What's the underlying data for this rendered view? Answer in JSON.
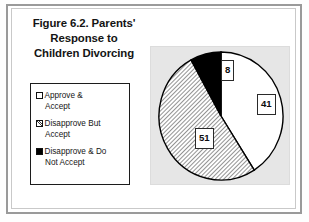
{
  "figure": {
    "title_lines": [
      "Figure 6.2. Parents'",
      "Response to",
      "Children Divorcing"
    ],
    "title_full": "Figure 6.2. Parents' Response to Children Divorcing"
  },
  "legend": {
    "items": [
      {
        "swatch": "white-square-icon",
        "line1": "Approve &",
        "line2": "Accept",
        "label": "Approve & Accept"
      },
      {
        "swatch": "hatched-square-icon",
        "line1": "Disapprove But",
        "line2": "Accept",
        "label": "Disapprove But Accept"
      },
      {
        "swatch": "black-square-icon",
        "line1": "Disapprove & Do",
        "line2": "Not Accept",
        "label": "Disapprove & Do Not Accept"
      }
    ]
  },
  "data_labels": {
    "approve": "41",
    "disapprove_but_accept": "51",
    "disapprove_not_accept": "8"
  },
  "colors": {
    "approve_fill": "#ffffff",
    "disapprove_but_accept_fill": "#d0d0d0",
    "disapprove_not_accept_fill": "#000000",
    "slice_stroke": "#000000",
    "plot_background": "#e6e6e6",
    "frame": "#9a9a9a",
    "text": "#141414"
  },
  "chart_data": {
    "type": "pie",
    "title": "Figure 6.2. Parents' Response to Children Divorcing",
    "categories": [
      "Approve & Accept",
      "Disapprove But Accept",
      "Disapprove & Do Not Accept"
    ],
    "values": [
      41,
      51,
      8
    ],
    "value_labels": [
      "41",
      "51",
      "8"
    ],
    "units": "percent",
    "total": 100,
    "legend_position": "left",
    "grid": false,
    "slice_styles": [
      "solid-white",
      "diagonal-hatch",
      "solid-black"
    ],
    "start_angle_deg": 0,
    "direction": "clockwise"
  }
}
